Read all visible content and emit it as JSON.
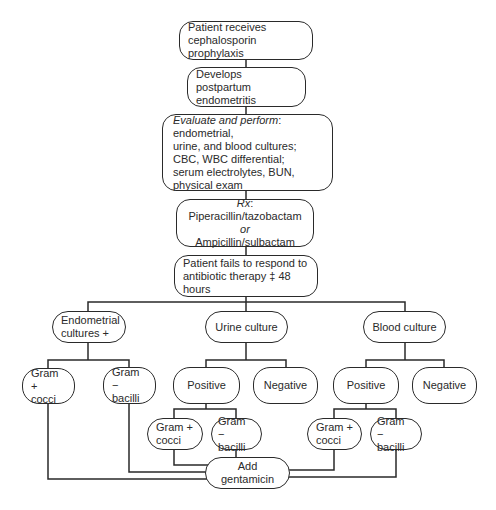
{
  "diagram": {
    "type": "flowchart",
    "nodes": {
      "start": "Patient receives\ncephalosporin prophylaxis",
      "develops": "Develops postpartum\nendometritis",
      "evaluate_em": "Evaluate and perform",
      "evaluate_rest": ": endometrial,\nurine, and blood cultures;\nCBC, WBC differential;\nserum electrolytes, BUN,\nphysical exam",
      "rx_em": "Rx",
      "rx_line1": ": Piperacillin/tazobactam",
      "rx_or": "or",
      "rx_line2": "Ampicillin/sulbactam",
      "fails": "Patient fails to respond to\nantibiotic therapy ‡ 48 hours",
      "endometrial": "Endometrial\ncultures +",
      "urine": "Urine culture",
      "blood": "Blood culture",
      "endo_gram_pos": "Gram +\ncocci",
      "endo_gram_neg": "Gram −\nbacilli",
      "urine_positive": "Positive",
      "urine_negative": "Negative",
      "blood_positive": "Positive",
      "blood_negative": "Negative",
      "urine_gram_pos": "Gram +\ncocci",
      "urine_gram_neg": "Gram −\nbacilli",
      "blood_gram_pos": "Gram +\ncocci",
      "blood_gram_neg": "Gram −\nbacilli",
      "gentamicin": "Add gentamicin"
    },
    "edges": [
      [
        "start",
        "develops"
      ],
      [
        "develops",
        "evaluate"
      ],
      [
        "evaluate",
        "rx"
      ],
      [
        "rx",
        "fails"
      ],
      [
        "fails",
        "endometrial"
      ],
      [
        "fails",
        "urine"
      ],
      [
        "fails",
        "blood"
      ],
      [
        "endometrial",
        "endo_gram_pos"
      ],
      [
        "endometrial",
        "endo_gram_neg"
      ],
      [
        "urine",
        "urine_positive"
      ],
      [
        "urine",
        "urine_negative"
      ],
      [
        "blood",
        "blood_positive"
      ],
      [
        "blood",
        "blood_negative"
      ],
      [
        "urine_positive",
        "urine_gram_pos"
      ],
      [
        "urine_positive",
        "urine_gram_neg"
      ],
      [
        "blood_positive",
        "blood_gram_pos"
      ],
      [
        "blood_positive",
        "blood_gram_neg"
      ],
      [
        "endo_gram_pos",
        "gentamicin"
      ],
      [
        "endo_gram_neg",
        "gentamicin"
      ],
      [
        "urine_gram_pos",
        "gentamicin"
      ],
      [
        "urine_gram_neg",
        "gentamicin"
      ],
      [
        "blood_gram_pos",
        "gentamicin"
      ],
      [
        "blood_gram_neg",
        "gentamicin"
      ]
    ],
    "colors": {
      "line": "#2a2a2a",
      "background": "#ffffff",
      "text": "#2a2a2a"
    }
  }
}
